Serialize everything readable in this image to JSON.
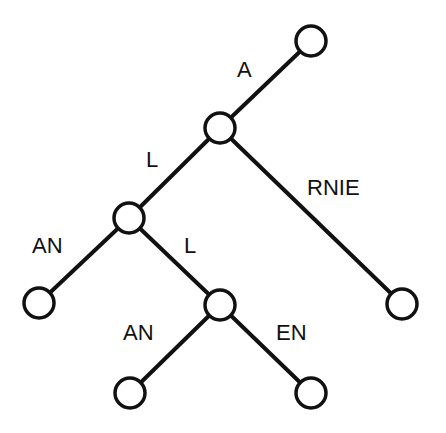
{
  "diagram": {
    "type": "tree",
    "nodes": [
      {
        "id": "n0",
        "x": 311,
        "y": 41
      },
      {
        "id": "n1",
        "x": 220,
        "y": 128
      },
      {
        "id": "n2",
        "x": 129,
        "y": 218
      },
      {
        "id": "n3",
        "x": 402,
        "y": 304
      },
      {
        "id": "n4",
        "x": 39,
        "y": 303
      },
      {
        "id": "n5",
        "x": 220,
        "y": 305
      },
      {
        "id": "n6",
        "x": 130,
        "y": 393
      },
      {
        "id": "n7",
        "x": 311,
        "y": 393
      }
    ],
    "edges": [
      {
        "from": "n1",
        "to": "n0",
        "label": "A"
      },
      {
        "from": "n1",
        "to": "n2",
        "label": "L"
      },
      {
        "from": "n1",
        "to": "n3",
        "label": "RNIE"
      },
      {
        "from": "n2",
        "to": "n4",
        "label": "AN"
      },
      {
        "from": "n2",
        "to": "n5",
        "label": "L"
      },
      {
        "from": "n5",
        "to": "n6",
        "label": "AN"
      },
      {
        "from": "n5",
        "to": "n7",
        "label": "EN"
      }
    ],
    "labels": {
      "a": "A",
      "l1": "L",
      "rnie": "RNIE",
      "an1": "AN",
      "l2": "L",
      "an2": "AN",
      "en": "EN"
    }
  }
}
